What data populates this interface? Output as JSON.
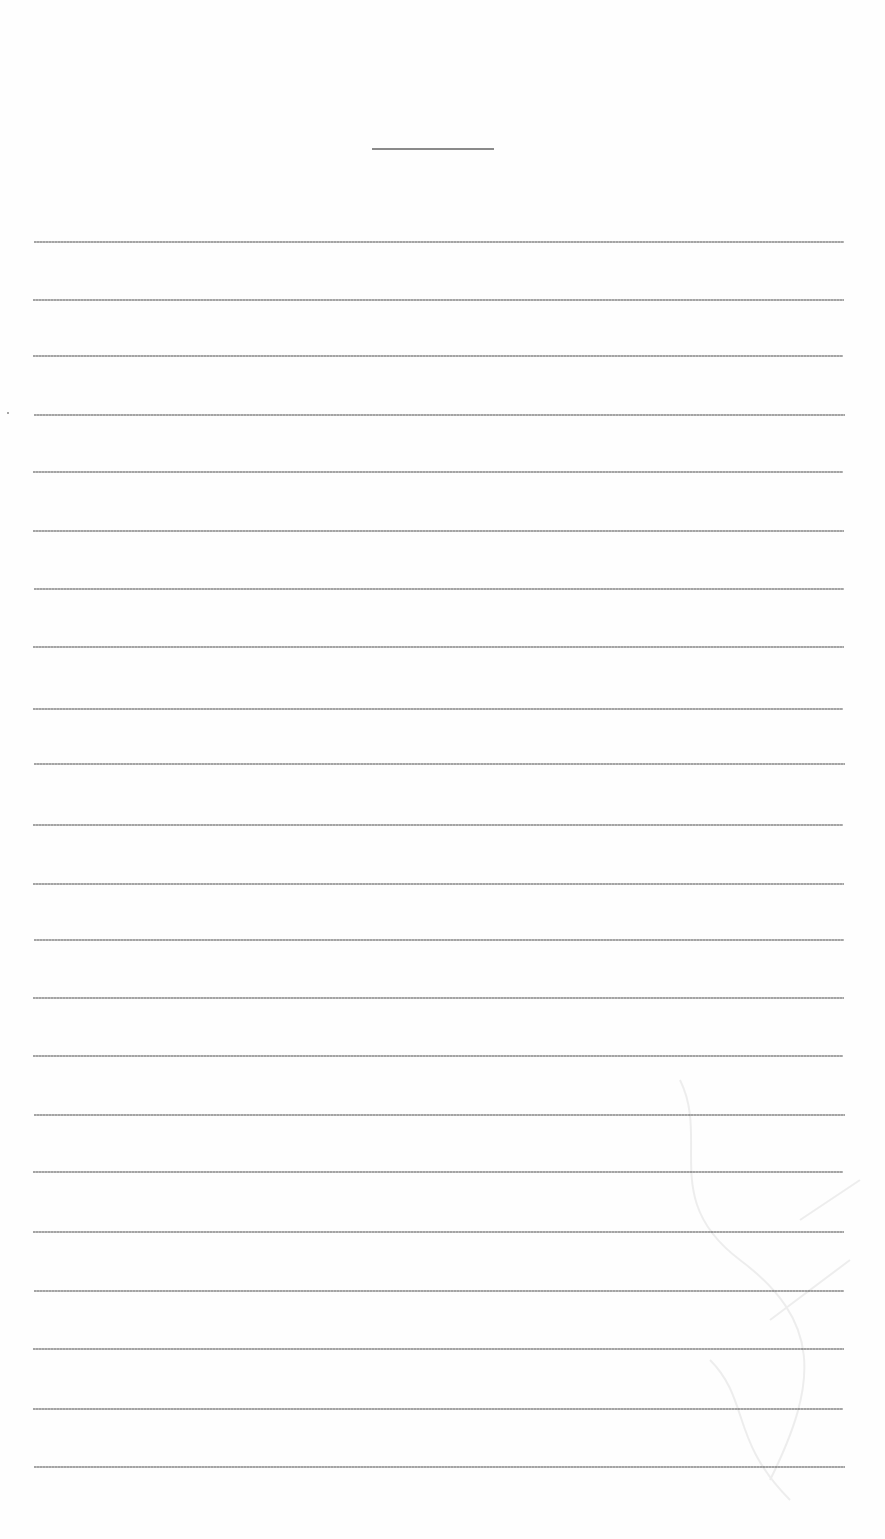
{
  "document": {
    "type": "blank ruled sheet",
    "title_line": {
      "present": true,
      "text": ""
    },
    "ruled_lines": {
      "count": 22,
      "left": 33,
      "right": 843,
      "positions_y": [
        241,
        299,
        355,
        414,
        471,
        530,
        588,
        646,
        708,
        763,
        824,
        883,
        939,
        997,
        1055,
        1114,
        1171,
        1231,
        1290,
        1348,
        1408,
        1466
      ],
      "lines": [
        "",
        "",
        "",
        "",
        "",
        "",
        "",
        "",
        "",
        "",
        "",
        "",
        "",
        "",
        "",
        "",
        "",
        "",
        "",
        "",
        "",
        ""
      ]
    },
    "colors": {
      "paper": "#fefefe",
      "rule": "#9a9a9a",
      "title_rule": "#8a8a8a"
    }
  }
}
